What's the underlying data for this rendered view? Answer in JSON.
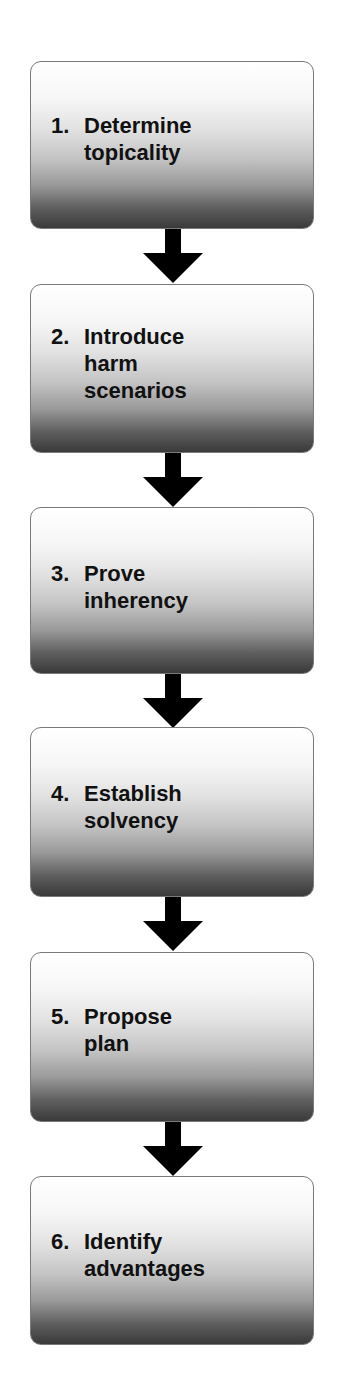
{
  "diagram": {
    "type": "flowchart",
    "direction": "top-to-bottom",
    "steps": [
      {
        "number": "1.",
        "lines": [
          "Determine",
          "topicality"
        ]
      },
      {
        "number": "2.",
        "lines": [
          "Introduce",
          "harm",
          "scenarios"
        ]
      },
      {
        "number": "3.",
        "lines": [
          "Prove",
          "inherency"
        ]
      },
      {
        "number": "4.",
        "lines": [
          "Establish",
          "solvency"
        ]
      },
      {
        "number": "5.",
        "lines": [
          "Propose",
          "plan"
        ]
      },
      {
        "number": "6.",
        "lines": [
          "Identify",
          "advantages"
        ]
      }
    ],
    "colors": {
      "box_gradient_top": "#ffffff",
      "box_gradient_bottom": "#3a3a3a",
      "box_border": "#7a7a7a",
      "arrow": "#000000",
      "text": "#111111"
    }
  }
}
